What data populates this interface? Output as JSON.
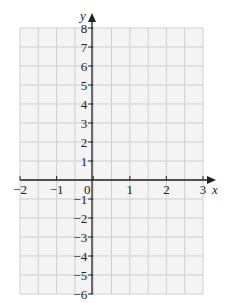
{
  "chart_data": {
    "type": "scatter",
    "title": "",
    "xlabel": "x",
    "ylabel": "y",
    "xlim": [
      -2,
      3
    ],
    "ylim": [
      -6,
      8
    ],
    "x_ticks": [
      -2,
      -1,
      0,
      1,
      2,
      3
    ],
    "y_ticks": [
      -6,
      -5,
      -4,
      -3,
      -2,
      -1,
      1,
      2,
      3,
      4,
      5,
      6,
      7,
      8
    ],
    "x_tick_labels": [
      "−2",
      "−1",
      "0",
      "1",
      "2",
      "3"
    ],
    "y_tick_labels": [
      "−6",
      "−5",
      "−4",
      "−3",
      "−2",
      "−1",
      "1",
      "2",
      "3",
      "4",
      "5",
      "6",
      "7",
      "8"
    ],
    "grid": true,
    "grid_x_step": 0.5,
    "grid_y_step": 1,
    "series": [],
    "colors": {
      "background": "#f4f4f4",
      "grid": "#cfcfcf",
      "axis": "#222222"
    }
  },
  "axes": {
    "x_label": "x",
    "y_label": "y",
    "origin_label": "0"
  }
}
